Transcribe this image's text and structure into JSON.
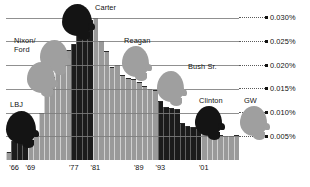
{
  "chart_data": {
    "type": "bar",
    "title": "",
    "subtitle": "",
    "xlabel": "",
    "ylabel": "",
    "grid": true,
    "legend_position": "none",
    "ylim": [
      0,
      0.032
    ],
    "ytick_labels": [
      "0.030%",
      "0.025%",
      "0.020%",
      "0.015%",
      "0.010%",
      "0.005%"
    ],
    "ytick_values": [
      0.03,
      0.025,
      0.02,
      0.015,
      0.01,
      0.005
    ],
    "xtick_labels": [
      "'66",
      "'69",
      "'77",
      "'81",
      "'89",
      "'93",
      "'01"
    ],
    "xtick_years": [
      1966,
      1969,
      1977,
      1981,
      1989,
      1993,
      2001
    ],
    "categories": [
      1965,
      1966,
      1967,
      1968,
      1969,
      1970,
      1971,
      1972,
      1973,
      1974,
      1975,
      1976,
      1977,
      1978,
      1979,
      1980,
      1981,
      1982,
      1983,
      1984,
      1985,
      1986,
      1987,
      1988,
      1989,
      1990,
      1991,
      1992,
      1993,
      1994,
      1995,
      1996,
      1997,
      1998,
      1999,
      2000,
      2001,
      2002,
      2003,
      2004,
      2005,
      2006,
      2007
    ],
    "values": [
      0.0017,
      0.004,
      0.0045,
      0.005,
      0.005,
      0.0052,
      0.01,
      0.014,
      0.0175,
      0.0225,
      0.023,
      0.0232,
      0.0245,
      0.0265,
      0.03,
      0.0295,
      0.03,
      0.025,
      0.023,
      0.0195,
      0.02,
      0.018,
      0.0173,
      0.017,
      0.0165,
      0.0155,
      0.015,
      0.0148,
      0.0125,
      0.0112,
      0.011,
      0.0108,
      0.0078,
      0.0072,
      0.007,
      0.0068,
      0.0062,
      0.0058,
      0.0056,
      0.0053,
      0.0051,
      0.005,
      0.0053
    ],
    "series_colors": {
      "dark": "#1b1b1b",
      "light": "#9a9a9a"
    },
    "bar_shading": [
      "light",
      "dark",
      "dark",
      "dark",
      "light",
      "light",
      "light",
      "light",
      "light",
      "light",
      "light",
      "light",
      "dark",
      "dark",
      "dark",
      "dark",
      "light",
      "light",
      "light",
      "light",
      "light",
      "light",
      "light",
      "light",
      "light",
      "light",
      "light",
      "light",
      "dark",
      "dark",
      "dark",
      "dark",
      "dark",
      "dark",
      "dark",
      "dark",
      "light",
      "light",
      "light",
      "light",
      "light",
      "light",
      "light"
    ],
    "annotations": [
      {
        "label": "LBJ",
        "silhouette": "dark",
        "term": "1965-1968"
      },
      {
        "label": "Nixon/\nFord",
        "silhouette": "light",
        "term": "1969-1976"
      },
      {
        "label": "Carter",
        "silhouette": "dark",
        "term": "1977-1980"
      },
      {
        "label": "Reagan",
        "silhouette": "light",
        "term": "1981-1988"
      },
      {
        "label": "Bush Sr.",
        "silhouette": "light",
        "term": "1989-1992"
      },
      {
        "label": "Clinton",
        "silhouette": "dark",
        "term": "1993-2000"
      },
      {
        "label": "GW",
        "silhouette": "light",
        "term": "2001-2007"
      }
    ]
  },
  "annotations": {
    "lbj": {
      "label": "LBJ"
    },
    "nixon_ford": {
      "line1": "Nixon/",
      "line2": "Ford"
    },
    "carter": {
      "label": "Carter"
    },
    "reagan": {
      "label": "Reagan"
    },
    "bush_sr": {
      "label": "Bush Sr."
    },
    "clinton": {
      "label": "Clinton"
    },
    "gw": {
      "label": "GW"
    }
  },
  "yaxis": {
    "ticks": [
      {
        "label": "0.030%"
      },
      {
        "label": "0.025%"
      },
      {
        "label": "0.020%"
      },
      {
        "label": "0.015%"
      },
      {
        "label": "0.010%"
      },
      {
        "label": "0.005%"
      }
    ]
  },
  "xaxis": {
    "ticks": [
      {
        "label": "'66"
      },
      {
        "label": "'69"
      },
      {
        "label": "'77"
      },
      {
        "label": "'81"
      },
      {
        "label": "'89"
      },
      {
        "label": "'93"
      },
      {
        "label": "'01"
      }
    ]
  }
}
